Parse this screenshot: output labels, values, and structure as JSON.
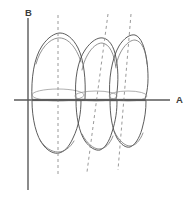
{
  "figure": {
    "background_color": "#ffffff",
    "width": 193,
    "height": 199
  },
  "axes": {
    "horizontal": {
      "label": "A",
      "name": "horizontal-axis",
      "color": "#5a5a5a",
      "label_x": 176,
      "label_y": 100,
      "x1": 14,
      "y1": 100,
      "x2": 170,
      "y2": 100
    },
    "vertical": {
      "label": "B",
      "name": "vertical-axis",
      "color": "#5a5a5a",
      "label_x": 25,
      "label_y": 13,
      "x1": 28,
      "y1": 18,
      "x2": 28,
      "y2": 190
    }
  },
  "style": {
    "outline_color": "#4a4a4a",
    "inner_color": "#6e6e6e",
    "dashed_color": "#9a9a9a",
    "cervical_color": "#8d8d8d",
    "dash_pattern": "3 3"
  },
  "chart_data": {
    "type": "diagram",
    "xlabel": "A",
    "ylabel": "B",
    "grid": false,
    "legend": null,
    "reference_lines": {
      "horizontal_y": 100,
      "vertical_x": 28
    },
    "teeth": [
      {
        "name": "tooth-1",
        "position_index": 1,
        "crown_apex_x": 58,
        "crown_apex_y": 37,
        "cervical_y": 97,
        "root_apex_x": 58,
        "root_apex_y": 152,
        "long_axis_top_x": 58,
        "long_axis_top_y": 15,
        "long_axis_bottom_x": 58,
        "long_axis_bottom_y": 175,
        "long_axis_tilt_deg": 0,
        "crown_outline": "M 32 99 C 31 78 34 58 42 46 C 48 37 55 33 60 33 C 66 33 73 38 78 48 C 84 60 86 80 85 99 Z",
        "crown_inner": "M 36 64 C 40 49 49 39 58 38 C 67 37 76 46 81 62",
        "root_outline": "M 32 101 C 32 118 36 137 44 146 C 49 152 55 154 59 153 C 64 152 69 147 73 138 C 79 126 81 112 81 101 Z",
        "root_inner": "M 40 140 C 45 148 52 152 58 152 C 64 152 70 148 74 141",
        "cervical_ellipse": {
          "cx": 58,
          "cy": 95,
          "rx": 26,
          "ry": 6
        },
        "cervical_line": "M 32 100 L 85 100"
      },
      {
        "name": "tooth-2",
        "position_index": 2,
        "crown_apex_x": 96,
        "crown_apex_y": 42,
        "cervical_y": 98,
        "root_apex_x": 90,
        "root_apex_y": 148,
        "long_axis_top_x": 108,
        "long_axis_top_y": 14,
        "long_axis_bottom_x": 87,
        "long_axis_bottom_y": 172,
        "long_axis_tilt_deg": -8,
        "crown_outline": "M 76 99 C 74 80 78 60 85 50 C 91 41 98 37 103 38 C 109 39 114 46 116 58 C 119 72 118 88 116 99 Z",
        "crown_inner": "M 82 70 C 85 55 94 43 102 43 C 110 44 114 54 116 68",
        "root_outline": "M 76 101 C 76 116 79 132 85 141 C 90 148 96 151 100 150 C 105 148 109 142 112 132 C 116 120 117 110 117 101 Z",
        "root_inner": "M 82 134 C 87 144 94 149 99 149 C 105 149 110 144 113 136",
        "cervical_ellipse": {
          "cx": 96,
          "cy": 96,
          "rx": 21,
          "ry": 5
        },
        "cervical_line": "M 76 100 L 117 100"
      },
      {
        "name": "tooth-3",
        "position_index": 3,
        "crown_apex_x": 130,
        "crown_apex_y": 38,
        "cervical_y": 98,
        "root_apex_x": 122,
        "root_apex_y": 146,
        "long_axis_top_x": 131,
        "long_axis_top_y": 14,
        "long_axis_bottom_x": 118,
        "long_axis_bottom_y": 170,
        "long_axis_tilt_deg": -5,
        "crown_outline": "M 110 99 C 108 80 112 58 119 46 C 124 38 130 34 135 35 C 141 37 145 47 147 62 C 149 78 148 90 145 99 Z",
        "crown_inner": "M 116 66 C 119 50 128 40 135 40 C 142 41 146 51 147 64",
        "root_outline": "M 110 101 C 110 114 112 129 117 138 C 121 145 126 148 130 147 C 135 145 139 139 142 129 C 145 118 146 110 146 101 Z",
        "root_inner": "M 114 131 C 119 141 125 146 130 146 C 135 146 140 141 143 133",
        "cervical_ellipse": {
          "cx": 128,
          "cy": 96,
          "rx": 19,
          "ry": 5
        },
        "cervical_line": "M 110 100 L 146 100"
      }
    ]
  }
}
